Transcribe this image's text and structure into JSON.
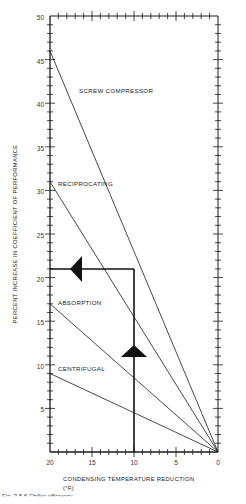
{
  "chart_data": {
    "type": "line",
    "title": "",
    "xlabel": "CONDENSING TEMPERATURE REDUCTION",
    "xlabel_unit": "(°F)",
    "ylabel": "PERCENT INCREASE IN COEFFICIENT OF PERFORMANCE",
    "xlim": [
      20,
      0
    ],
    "ylim": [
      0,
      50
    ],
    "x_reversed": true,
    "x_ticks": [
      20,
      15,
      10,
      5,
      0
    ],
    "y_ticks": [
      5,
      10,
      15,
      20,
      25,
      30,
      35,
      40,
      45,
      50
    ],
    "x_minor_step": 1,
    "y_minor_step": 1,
    "grid": false,
    "legend": "inline labels",
    "series": [
      {
        "name": "SCREW COMPRESSOR",
        "x": [
          20,
          0
        ],
        "y": [
          46,
          0
        ],
        "label_pos": [
          14.5,
          42
        ]
      },
      {
        "name": "RECIPROCATING",
        "x": [
          20,
          0
        ],
        "y": [
          31,
          0
        ],
        "label_pos": [
          19.5,
          30.5
        ]
      },
      {
        "name": "ABSORPTION",
        "x": [
          20,
          0
        ],
        "y": [
          17,
          0
        ],
        "label_pos": [
          19.3,
          16.5
        ]
      },
      {
        "name": "CENTRIFUGAL",
        "x": [
          20,
          0
        ],
        "y": [
          9,
          0
        ],
        "label_pos": [
          19.3,
          9.2
        ]
      }
    ],
    "annotations": [
      {
        "type": "guide-vertical",
        "x": 9,
        "y_from": 0,
        "y_to": 21,
        "arrow": "up",
        "arrow_at_y": 12
      },
      {
        "type": "guide-horizontal",
        "y": 21,
        "x_from": 9,
        "x_to": 20,
        "arrow": "left",
        "arrow_at_x": 16.5
      }
    ]
  },
  "labels": {
    "screw": "SCREW COMPRESSOR",
    "reciprocating": "RECIPROCATING",
    "absorption": "ABSORPTION",
    "centrifugal": "CENTRIFUGAL",
    "x_title": "CONDENSING TEMPERATURE REDUCTION",
    "x_unit": "(°F)",
    "y_title": "PERCENT INCREASE IN COEFFICIENT OF PERFORMANCE",
    "caption": "Fig. 3-5.6   Chiller efficiency"
  },
  "ticks": {
    "y": [
      "5",
      "10",
      "15",
      "20",
      "25",
      "30",
      "35",
      "40",
      "45",
      "50"
    ],
    "x": [
      "20",
      "15",
      "10",
      "5",
      "0"
    ]
  }
}
